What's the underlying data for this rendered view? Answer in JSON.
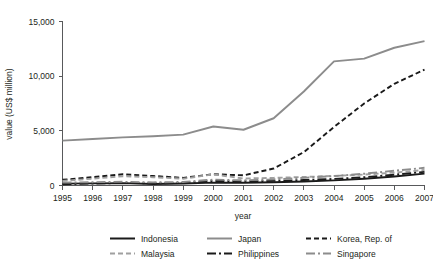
{
  "chart_data": {
    "type": "line",
    "title": "",
    "xlabel": "year",
    "ylabel": "value (US$ million)",
    "x": [
      1995,
      1996,
      1997,
      1998,
      1999,
      2000,
      2001,
      2002,
      2003,
      2004,
      2005,
      2006,
      2007
    ],
    "categories": [
      "1995",
      "1996",
      "1997",
      "1998",
      "1999",
      "2000",
      "2001",
      "2002",
      "2003",
      "2004",
      "2005",
      "2006",
      "2007"
    ],
    "xlim": [
      1995,
      2007
    ],
    "ylim": [
      0,
      15000
    ],
    "yticks": [
      0,
      5000,
      10000,
      15000
    ],
    "ytick_labels": [
      "0",
      "5,000",
      "10,000",
      "15,000"
    ],
    "grid": false,
    "legend_position": "bottom",
    "series": [
      {
        "name": "Indonesia",
        "color": "#1a1a1a",
        "dash": "none",
        "width": 1.9,
        "values": [
          170,
          190,
          215,
          140,
          185,
          265,
          250,
          300,
          360,
          470,
          620,
          830,
          1090
        ]
      },
      {
        "name": "Japan",
        "color": "#8c8c8c",
        "dash": "none",
        "width": 1.9,
        "values": [
          4100,
          4250,
          4400,
          4500,
          4650,
          5400,
          5100,
          6150,
          8600,
          11350,
          11600,
          12600,
          13200
        ]
      },
      {
        "name": "Korea, Rep. of",
        "color": "#1a1a1a",
        "dash": "dashed",
        "width": 1.9,
        "values": [
          520,
          760,
          1030,
          870,
          700,
          1030,
          930,
          1550,
          3050,
          5350,
          7500,
          9300,
          10600
        ]
      },
      {
        "name": "Malaysia",
        "color": "#a0a0a0",
        "dash": "dashed",
        "width": 1.9,
        "values": [
          420,
          620,
          850,
          760,
          620,
          1020,
          640,
          700,
          780,
          880,
          1000,
          1180,
          1420
        ]
      },
      {
        "name": "Philippines",
        "color": "#1a1a1a",
        "dash": "dashdot",
        "width": 1.9,
        "values": [
          120,
          180,
          230,
          200,
          230,
          420,
          380,
          420,
          500,
          600,
          760,
          980,
          1250
        ]
      },
      {
        "name": "Singapore",
        "color": "#8c8c8c",
        "dash": "dashdot",
        "width": 1.9,
        "values": [
          260,
          300,
          340,
          290,
          320,
          540,
          470,
          560,
          700,
          860,
          1080,
          1350,
          1620
        ]
      }
    ]
  },
  "legend": {
    "rows": [
      [
        {
          "label": "Indonesia",
          "style": "solid-dark"
        },
        {
          "label": "Japan",
          "style": "solid-gray"
        },
        {
          "label": "Korea, Rep. of",
          "style": "dashed-dark"
        }
      ],
      [
        {
          "label": "Malaysia",
          "style": "dashed-gray"
        },
        {
          "label": "Philippines",
          "style": "dashdot-dark"
        },
        {
          "label": "Singapore",
          "style": "dashdot-gray"
        }
      ]
    ]
  }
}
